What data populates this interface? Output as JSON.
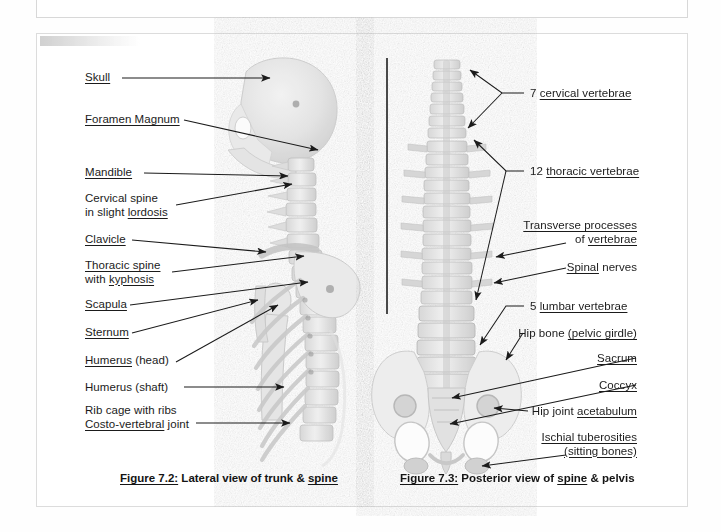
{
  "document": {
    "background_color": "#fefefe",
    "ink_color": "#1b1b1b",
    "divider_color": "#4a4a4a"
  },
  "figure_left": {
    "id": "figure-7-2",
    "caption_prefix": "Figure 7.2:",
    "caption_text": "Lateral view of trunk &",
    "caption_underlined_word": "spine",
    "labels": [
      {
        "id": "skull",
        "plain": "Skull",
        "underline": "Skull",
        "second_line": ""
      },
      {
        "id": "foramen-magnum",
        "plain": "Foramen Magnum",
        "underline": "Foramen Magnum",
        "second_line": ""
      },
      {
        "id": "mandible",
        "plain": "Mandible",
        "underline": "Mandible",
        "second_line": ""
      },
      {
        "id": "cervical-spine",
        "plain": "Cervical spine",
        "underline": "",
        "second_line": "in slight lordosis",
        "second_underline": "lordosis"
      },
      {
        "id": "clavicle",
        "plain": "Clavicle",
        "underline": "Clavicle",
        "second_line": ""
      },
      {
        "id": "thoracic-spine",
        "plain": "Thoracic spine",
        "underline": "Thoracic spine",
        "second_line": "with kyphosis",
        "second_underline": "kyphosis"
      },
      {
        "id": "scapula",
        "plain": "Scapula",
        "underline": "Scapula",
        "second_line": ""
      },
      {
        "id": "sternum",
        "plain": "Sternum",
        "underline": "Sternum",
        "second_line": ""
      },
      {
        "id": "humerus-head",
        "plain": "Humerus",
        "underline": "Humerus",
        "suffix": " (head)",
        "second_line": ""
      },
      {
        "id": "humerus-shaft",
        "plain": "Humerus (shaft)",
        "underline": "",
        "second_line": ""
      },
      {
        "id": "rib-cage",
        "plain": "Rib cage with ribs",
        "underline": "",
        "second_line": "Costo-vertebral joint",
        "second_underline": "Costo-vertebral"
      }
    ]
  },
  "figure_right": {
    "id": "figure-7-3",
    "caption_prefix": "Figure 7.3:",
    "caption_text_a": "Posterior view of",
    "caption_underlined_word": "spine",
    "caption_text_b": "& pelvis",
    "labels": [
      {
        "id": "cervical-vertebrae",
        "count": "7",
        "term": "cervical vertebrae"
      },
      {
        "id": "thoracic-vertebrae",
        "count": "12",
        "term": "thoracic vertebrae"
      },
      {
        "id": "transverse-processes",
        "line1": "Transverse processes",
        "line1_underline": "Transverse processes",
        "line2": "of vertebrae",
        "line2_underline": "vertebrae"
      },
      {
        "id": "spinal-nerves",
        "line1": "Spinal nerves",
        "line1_underline": "Spinal"
      },
      {
        "id": "lumbar-vertebrae",
        "count": "5",
        "term": "lumbar vertebrae"
      },
      {
        "id": "hip-bone",
        "plain": "Hip bone",
        "underline": "(pelvic girdle)"
      },
      {
        "id": "sacrum",
        "plain": "Sacrum",
        "underline": "Sacrum"
      },
      {
        "id": "coccyx",
        "plain": "Coccyx",
        "underline": "Coccyx"
      },
      {
        "id": "hip-joint",
        "plain": "Hip joint",
        "underline": "acetabulum"
      },
      {
        "id": "ischial-tuberosities",
        "line1": "Ischial tuberosities",
        "line1_underline": "Ischial tuberosities",
        "line2": "(sitting bones)",
        "line2_underline": "(sitting bones)"
      }
    ]
  }
}
